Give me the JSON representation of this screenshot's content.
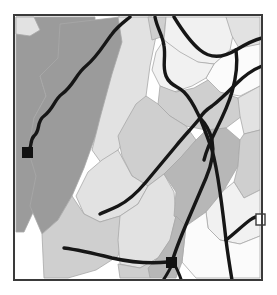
{
  "document": {
    "type": "thematic-region-map",
    "title": "Regional Zone Map",
    "width": 277,
    "height": 295,
    "background_color": "#ffffff"
  },
  "frame": {
    "name": "map-border",
    "x": 14,
    "y": 15,
    "width": 248,
    "height": 265,
    "stroke_color": "#3a3a3a",
    "stroke_width": 2,
    "fill_color": "#ffffff"
  },
  "palette": {
    "dark_gray": "#9b9b9b",
    "mid_gray": "#b7b7b7",
    "light_gray": "#cfcfcf",
    "pale_gray": "#e2e2e2",
    "near_white": "#f1f1f1",
    "white": "#fbfbfb",
    "road_color": "#161616",
    "marker_color": "#111111",
    "polygon_edge": "#a8a8a8"
  },
  "regions": [
    {
      "id": "r1",
      "label": "West Upland",
      "fill": "dark_gray",
      "points": "16,17 95,17 95,30 62,38 60,58 40,76 46,96 34,118 30,150 40,176 36,206 24,232 16,232"
    },
    {
      "id": "r2",
      "label": "Northwest Notch",
      "fill": "pale_gray",
      "points": "16,17 34,17 40,30 30,36 16,34"
    },
    {
      "id": "r3",
      "label": "Central Ridge",
      "fill": "dark_gray",
      "points": "60,24 120,17 126,40 118,70 106,108 94,140 84,168 72,196 58,220 42,234 30,206 36,176 28,150 34,118 46,96 40,76 58,58"
    },
    {
      "id": "r4",
      "label": "North Corridor",
      "fill": "pale_gray",
      "points": "118,17 152,17 156,36 150,66 146,96 134,126 118,150 102,164 92,150 100,118 112,74 122,42"
    },
    {
      "id": "r5",
      "label": "North Ridge Tip",
      "fill": "light_gray",
      "points": "148,17 166,17 164,36 152,40"
    },
    {
      "id": "r6",
      "label": "Northeast Basin",
      "fill": "near_white",
      "points": "166,17 226,17 234,30 230,50 214,64 196,62 178,52 164,40"
    },
    {
      "id": "r7",
      "label": "Northeast Edge",
      "fill": "pale_gray",
      "points": "226,17 260,17 260,44 240,50 232,36"
    },
    {
      "id": "r8",
      "label": "East Shelf",
      "fill": "white",
      "points": "230,50 260,44 260,86 240,96 218,92 206,78 214,64"
    },
    {
      "id": "r9",
      "label": "Upper East Flat",
      "fill": "near_white",
      "points": "164,40 180,52 198,62 214,64 206,78 192,86 174,92 160,86 152,70 156,52"
    },
    {
      "id": "r10",
      "label": "Mid East Terrace",
      "fill": "light_gray",
      "points": "160,86 176,92 194,88 208,80 220,92 238,98 242,116 226,128 206,130 186,126 170,116 158,104"
    },
    {
      "id": "r11",
      "label": "East Margin",
      "fill": "pale_gray",
      "points": "238,98 260,86 260,130 244,134 240,116"
    },
    {
      "id": "r12",
      "label": "Central Valley",
      "fill": "light_gray",
      "points": "146,96 158,104 170,116 186,126 196,140 182,156 164,174 148,186 132,176 122,156 118,136 128,118 136,104"
    },
    {
      "id": "r13",
      "label": "Lower Central Pale",
      "fill": "pale_gray",
      "points": "118,150 132,176 148,186 138,204 120,216 100,222 84,214 76,196 88,172 102,160"
    },
    {
      "id": "r14",
      "label": "Southwest Apron",
      "fill": "light_gray",
      "points": "42,234 58,220 72,196 84,214 100,222 120,216 124,234 118,256 96,270 68,278 44,278"
    },
    {
      "id": "r15",
      "label": "South Pale Belt",
      "fill": "pale_gray",
      "points": "120,216 138,204 148,186 164,174 174,192 176,216 170,240 158,258 140,268 120,264 118,240"
    },
    {
      "id": "r16",
      "label": "Southeast Upland",
      "fill": "mid_gray",
      "points": "164,174 182,156 196,140 206,130 226,128 240,140 238,166 224,190 206,212 186,226 174,216 176,192"
    },
    {
      "id": "r17",
      "label": "East Lower Shelf",
      "fill": "light_gray",
      "points": "240,140 244,134 260,130 260,190 244,198 234,182 238,166"
    },
    {
      "id": "r18",
      "label": "Southeast Basin",
      "fill": "near_white",
      "points": "206,212 224,190 234,182 244,198 260,190 260,236 240,244 220,240 208,228"
    },
    {
      "id": "r19",
      "label": "South Pale Corner",
      "fill": "white",
      "points": "186,226 206,212 208,228 220,240 240,244 260,236 260,278 196,278 182,262"
    },
    {
      "id": "r20",
      "label": "South Central Grey",
      "fill": "mid_gray",
      "points": "158,258 170,240 176,216 186,226 182,262 176,278 150,278 148,268"
    },
    {
      "id": "r21",
      "label": "South Tail",
      "fill": "light_gray",
      "points": "140,268 158,258 148,268 150,278 120,278 118,264"
    }
  ],
  "roads": [
    {
      "id": "road-west-main",
      "label": "Western Highway",
      "d": "M 27,152 C 33,148 29,141 34,136 C 41,130 36,122 44,116 C 54,108 54,100 62,94 C 74,85 76,74 86,66 C 98,56 104,44 112,34 C 118,26 124,22 130,17",
      "width": 3.4
    },
    {
      "id": "road-north-spur",
      "label": "North Spur",
      "d": "M 155,17 C 157,28 163,36 164,46 C 166,58 162,66 166,76 C 170,86 178,86 184,92 C 192,100 196,110 200,118",
      "width": 3.4
    },
    {
      "id": "road-ne-arc",
      "label": "Northeast Arc",
      "d": "M 174,17 C 182,30 190,42 200,50 C 212,60 226,56 236,50 C 246,44 254,40 262,38",
      "width": 3.4
    },
    {
      "id": "road-east-link",
      "label": "East Link",
      "d": "M 262,66 C 252,70 244,76 236,84 C 228,92 220,100 212,106 C 206,110 202,114 200,118",
      "width": 3.4
    },
    {
      "id": "road-junction-se",
      "label": "Southeast Trunk",
      "d": "M 200,118 C 204,128 208,138 212,150 C 216,164 218,178 220,192 C 222,206 224,222 226,240 C 228,256 230,268 232,280",
      "width": 3.4
    },
    {
      "id": "road-center-diag",
      "label": "Central Diagonal",
      "d": "M 200,118 C 192,128 184,136 176,146 C 166,158 156,170 146,182 C 136,194 126,202 118,206 C 110,210 104,212 100,214",
      "width": 3.4
    },
    {
      "id": "road-south-main",
      "label": "South Main",
      "d": "M 172,262 C 176,248 182,234 188,220 C 194,206 200,192 206,178 C 212,164 214,150 212,140 C 210,132 206,124 200,118",
      "width": 3.4
    },
    {
      "id": "road-south-west",
      "label": "Southwest Branch",
      "d": "M 64,248 C 80,250 96,254 112,258 C 130,262 150,264 168,262",
      "width": 3.4
    },
    {
      "id": "road-south-fork1",
      "label": "South Fork West",
      "d": "M 172,264 C 170,270 166,276 162,282",
      "width": 3.0
    },
    {
      "id": "road-south-fork2",
      "label": "South Fork East",
      "d": "M 174,264 C 178,270 180,276 182,282",
      "width": 3.0
    },
    {
      "id": "road-east-edge",
      "label": "East Edge Road",
      "d": "M 226,240 C 234,234 242,226 250,220 C 254,217 258,216 262,216",
      "width": 3.4
    },
    {
      "id": "road-ne-down",
      "label": "Northeast Descent",
      "d": "M 236,50 C 238,64 236,78 232,92 C 228,106 222,118 216,130 C 210,142 206,152 204,160",
      "width": 3.4
    }
  ],
  "markers": [
    {
      "id": "marker-west",
      "label": "West Station",
      "x": 22,
      "y": 147,
      "size": 11
    },
    {
      "id": "marker-south",
      "label": "South Station",
      "x": 166,
      "y": 257,
      "size": 11
    }
  ],
  "inset_boxes": [
    {
      "id": "inset-east",
      "label": "East Inset",
      "x": 256,
      "y": 214,
      "width": 9,
      "height": 11,
      "fill": "#ffffff",
      "stroke": "#3a3a3a"
    }
  ]
}
